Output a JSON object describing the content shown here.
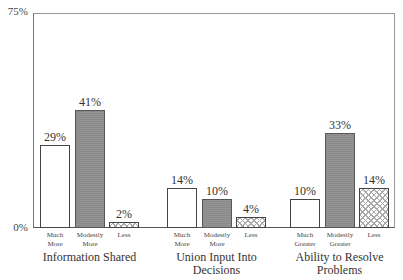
{
  "chart_data": {
    "type": "bar",
    "title": "",
    "xlabel": "",
    "ylabel": "",
    "ylim": [
      0,
      75
    ],
    "y_ticks": [
      "75%",
      "0%"
    ],
    "grid": false,
    "legend": null,
    "groups": [
      {
        "label": "Information Shared",
        "categories": [
          "Much More",
          "Modestly More",
          "Less"
        ],
        "values": [
          29,
          41,
          2
        ],
        "value_labels": [
          "29%",
          "41%",
          "2%"
        ]
      },
      {
        "label": "Union Input Into Decisions",
        "categories": [
          "Much More",
          "Modestly More",
          "Less"
        ],
        "values": [
          14,
          10,
          4
        ],
        "value_labels": [
          "14%",
          "10%",
          "4%"
        ]
      },
      {
        "label": "Ability to Resolve Problems",
        "categories": [
          "Much Greater",
          "Modestly Greater",
          "Less"
        ],
        "values": [
          10,
          33,
          14
        ],
        "value_labels": [
          "10%",
          "33%",
          "14%"
        ]
      }
    ],
    "bar_styles": [
      "white",
      "gray",
      "crosshatch"
    ]
  },
  "axis": {
    "y_top_label": "75%",
    "y_bottom_label": "0%"
  },
  "groups": [
    {
      "label_line1": "Information Shared",
      "label_line2": "",
      "bars": [
        {
          "value_label": "29%",
          "cat_line1": "Much",
          "cat_line2": "More"
        },
        {
          "value_label": "41%",
          "cat_line1": "Modestly",
          "cat_line2": "More"
        },
        {
          "value_label": "2%",
          "cat_line1": "Less",
          "cat_line2": ""
        }
      ]
    },
    {
      "label_line1": "Union Input Into",
      "label_line2": "Decisions",
      "bars": [
        {
          "value_label": "14%",
          "cat_line1": "Much",
          "cat_line2": "More"
        },
        {
          "value_label": "10%",
          "cat_line1": "Modestly",
          "cat_line2": "More"
        },
        {
          "value_label": "4%",
          "cat_line1": "Less",
          "cat_line2": ""
        }
      ]
    },
    {
      "label_line1": "Ability to Resolve",
      "label_line2": "Problems",
      "bars": [
        {
          "value_label": "10%",
          "cat_line1": "Much",
          "cat_line2": "Greater"
        },
        {
          "value_label": "33%",
          "cat_line1": "Modestly",
          "cat_line2": "Greater"
        },
        {
          "value_label": "14%",
          "cat_line1": "Less",
          "cat_line2": ""
        }
      ]
    }
  ]
}
